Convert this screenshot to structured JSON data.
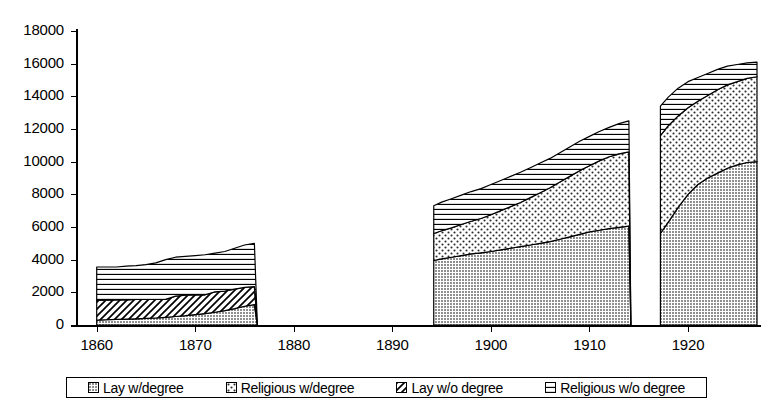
{
  "chart_data": {
    "type": "area",
    "title": "",
    "subtitle": "",
    "xlabel": "",
    "ylabel": "",
    "stacked": true,
    "grid": false,
    "legend_position": "bottom",
    "xlim": [
      1858,
      1927
    ],
    "ylim": [
      0,
      18000
    ],
    "y_ticks": [
      0,
      2000,
      4000,
      6000,
      8000,
      10000,
      12000,
      14000,
      16000,
      18000
    ],
    "y_tick_labels": [
      "0",
      "2000",
      "4000",
      "6000",
      "8000",
      "10000",
      "12000",
      "14000",
      "16000",
      "18000"
    ],
    "x_ticks": [
      1860,
      1870,
      1880,
      1890,
      1900,
      1910,
      1920
    ],
    "x_tick_labels": [
      "1860",
      "1870",
      "1880",
      "1890",
      "1900",
      "1910",
      "1920"
    ],
    "series": [
      {
        "name": "Lay w/degree",
        "pattern": "dense-dark-dots",
        "color": "#9a9a9a",
        "values": [
          {
            "x": 1860,
            "y": 300
          },
          {
            "x": 1861,
            "y": 320
          },
          {
            "x": 1862,
            "y": 340
          },
          {
            "x": 1863,
            "y": 360
          },
          {
            "x": 1864,
            "y": 380
          },
          {
            "x": 1865,
            "y": 400
          },
          {
            "x": 1866,
            "y": 430
          },
          {
            "x": 1867,
            "y": 470
          },
          {
            "x": 1868,
            "y": 520
          },
          {
            "x": 1869,
            "y": 570
          },
          {
            "x": 1870,
            "y": 640
          },
          {
            "x": 1871,
            "y": 700
          },
          {
            "x": 1872,
            "y": 780
          },
          {
            "x": 1873,
            "y": 880
          },
          {
            "x": 1874,
            "y": 1000
          },
          {
            "x": 1875,
            "y": 1150
          },
          {
            "x": 1876,
            "y": 1250
          },
          {
            "x": 1876.3,
            "y": 0
          },
          {
            "x": 1894,
            "y": 0
          },
          {
            "x": 1894.2,
            "y": 3950
          },
          {
            "x": 1895,
            "y": 4050
          },
          {
            "x": 1896,
            "y": 4150
          },
          {
            "x": 1897,
            "y": 4250
          },
          {
            "x": 1898,
            "y": 4350
          },
          {
            "x": 1899,
            "y": 4420
          },
          {
            "x": 1900,
            "y": 4500
          },
          {
            "x": 1901,
            "y": 4600
          },
          {
            "x": 1902,
            "y": 4700
          },
          {
            "x": 1903,
            "y": 4800
          },
          {
            "x": 1904,
            "y": 4900
          },
          {
            "x": 1905,
            "y": 5000
          },
          {
            "x": 1906,
            "y": 5100
          },
          {
            "x": 1907,
            "y": 5250
          },
          {
            "x": 1908,
            "y": 5400
          },
          {
            "x": 1909,
            "y": 5550
          },
          {
            "x": 1910,
            "y": 5700
          },
          {
            "x": 1911,
            "y": 5800
          },
          {
            "x": 1912,
            "y": 5900
          },
          {
            "x": 1913,
            "y": 5980
          },
          {
            "x": 1914,
            "y": 6050
          },
          {
            "x": 1914.2,
            "y": 0
          },
          {
            "x": 1917,
            "y": 0
          },
          {
            "x": 1917.2,
            "y": 5600
          },
          {
            "x": 1918,
            "y": 6300
          },
          {
            "x": 1919,
            "y": 7200
          },
          {
            "x": 1920,
            "y": 8000
          },
          {
            "x": 1921,
            "y": 8600
          },
          {
            "x": 1922,
            "y": 9000
          },
          {
            "x": 1923,
            "y": 9300
          },
          {
            "x": 1924,
            "y": 9600
          },
          {
            "x": 1925,
            "y": 9800
          },
          {
            "x": 1926,
            "y": 9950
          },
          {
            "x": 1927,
            "y": 10000
          }
        ]
      },
      {
        "name": "Religious w/degree",
        "pattern": "light-dots",
        "color": "#ffffff",
        "values": [
          {
            "x": 1860,
            "y": 0
          },
          {
            "x": 1876,
            "y": 0
          },
          {
            "x": 1876.3,
            "y": 0
          },
          {
            "x": 1894,
            "y": 0
          },
          {
            "x": 1894.2,
            "y": 1650
          },
          {
            "x": 1895,
            "y": 1720
          },
          {
            "x": 1896,
            "y": 1800
          },
          {
            "x": 1897,
            "y": 1900
          },
          {
            "x": 1898,
            "y": 2000
          },
          {
            "x": 1899,
            "y": 2100
          },
          {
            "x": 1900,
            "y": 2250
          },
          {
            "x": 1901,
            "y": 2400
          },
          {
            "x": 1902,
            "y": 2550
          },
          {
            "x": 1903,
            "y": 2700
          },
          {
            "x": 1904,
            "y": 2900
          },
          {
            "x": 1905,
            "y": 3100
          },
          {
            "x": 1906,
            "y": 3300
          },
          {
            "x": 1907,
            "y": 3500
          },
          {
            "x": 1908,
            "y": 3700
          },
          {
            "x": 1909,
            "y": 3900
          },
          {
            "x": 1910,
            "y": 4050
          },
          {
            "x": 1911,
            "y": 4250
          },
          {
            "x": 1912,
            "y": 4400
          },
          {
            "x": 1913,
            "y": 4500
          },
          {
            "x": 1914,
            "y": 4550
          },
          {
            "x": 1914.2,
            "y": 0
          },
          {
            "x": 1917,
            "y": 0
          },
          {
            "x": 1917.2,
            "y": 6000
          },
          {
            "x": 1918,
            "y": 5900
          },
          {
            "x": 1919,
            "y": 5600
          },
          {
            "x": 1920,
            "y": 5300
          },
          {
            "x": 1921,
            "y": 5100
          },
          {
            "x": 1922,
            "y": 5050
          },
          {
            "x": 1923,
            "y": 5100
          },
          {
            "x": 1924,
            "y": 5100
          },
          {
            "x": 1925,
            "y": 5100
          },
          {
            "x": 1926,
            "y": 5150
          },
          {
            "x": 1927,
            "y": 5200
          }
        ]
      },
      {
        "name": "Lay w/o degree",
        "pattern": "diagonal-hatch",
        "color": "#ffffff",
        "values": [
          {
            "x": 1860,
            "y": 1200
          },
          {
            "x": 1861,
            "y": 1200
          },
          {
            "x": 1862,
            "y": 1200
          },
          {
            "x": 1863,
            "y": 1180
          },
          {
            "x": 1864,
            "y": 1180
          },
          {
            "x": 1865,
            "y": 1160
          },
          {
            "x": 1866,
            "y": 1130
          },
          {
            "x": 1867,
            "y": 1100
          },
          {
            "x": 1868,
            "y": 1250
          },
          {
            "x": 1869,
            "y": 1250
          },
          {
            "x": 1870,
            "y": 1200
          },
          {
            "x": 1871,
            "y": 1150
          },
          {
            "x": 1872,
            "y": 1250
          },
          {
            "x": 1873,
            "y": 1200
          },
          {
            "x": 1874,
            "y": 1200
          },
          {
            "x": 1875,
            "y": 1150
          },
          {
            "x": 1876,
            "y": 1100
          },
          {
            "x": 1876.3,
            "y": 0
          },
          {
            "x": 1894,
            "y": 0
          },
          {
            "x": 1914.2,
            "y": 0
          },
          {
            "x": 1917,
            "y": 0
          },
          {
            "x": 1927,
            "y": 0
          }
        ]
      },
      {
        "name": "Religious w/o degree",
        "pattern": "horizontal-lines",
        "color": "#ffffff",
        "values": [
          {
            "x": 1860,
            "y": 2050
          },
          {
            "x": 1861,
            "y": 2030
          },
          {
            "x": 1862,
            "y": 2010
          },
          {
            "x": 1863,
            "y": 2060
          },
          {
            "x": 1864,
            "y": 2080
          },
          {
            "x": 1865,
            "y": 2140
          },
          {
            "x": 1866,
            "y": 2240
          },
          {
            "x": 1867,
            "y": 2430
          },
          {
            "x": 1868,
            "y": 2380
          },
          {
            "x": 1869,
            "y": 2380
          },
          {
            "x": 1870,
            "y": 2410
          },
          {
            "x": 1871,
            "y": 2450
          },
          {
            "x": 1872,
            "y": 2370
          },
          {
            "x": 1873,
            "y": 2420
          },
          {
            "x": 1874,
            "y": 2500
          },
          {
            "x": 1875,
            "y": 2600
          },
          {
            "x": 1876,
            "y": 2650
          },
          {
            "x": 1876.3,
            "y": 0
          },
          {
            "x": 1894,
            "y": 0
          },
          {
            "x": 1894.2,
            "y": 1700
          },
          {
            "x": 1895,
            "y": 1750
          },
          {
            "x": 1896,
            "y": 1780
          },
          {
            "x": 1897,
            "y": 1800
          },
          {
            "x": 1898,
            "y": 1820
          },
          {
            "x": 1899,
            "y": 1830
          },
          {
            "x": 1900,
            "y": 1850
          },
          {
            "x": 1901,
            "y": 1850
          },
          {
            "x": 1902,
            "y": 1850
          },
          {
            "x": 1903,
            "y": 1850
          },
          {
            "x": 1904,
            "y": 1830
          },
          {
            "x": 1905,
            "y": 1820
          },
          {
            "x": 1906,
            "y": 1800
          },
          {
            "x": 1907,
            "y": 1800
          },
          {
            "x": 1908,
            "y": 1800
          },
          {
            "x": 1909,
            "y": 1800
          },
          {
            "x": 1910,
            "y": 1800
          },
          {
            "x": 1911,
            "y": 1800
          },
          {
            "x": 1912,
            "y": 1800
          },
          {
            "x": 1913,
            "y": 1850
          },
          {
            "x": 1914,
            "y": 1900
          },
          {
            "x": 1914.2,
            "y": 0
          },
          {
            "x": 1917,
            "y": 0
          },
          {
            "x": 1917.2,
            "y": 1800
          },
          {
            "x": 1918,
            "y": 1750
          },
          {
            "x": 1919,
            "y": 1700
          },
          {
            "x": 1920,
            "y": 1600
          },
          {
            "x": 1921,
            "y": 1450
          },
          {
            "x": 1922,
            "y": 1350
          },
          {
            "x": 1923,
            "y": 1250
          },
          {
            "x": 1924,
            "y": 1150
          },
          {
            "x": 1925,
            "y": 1050
          },
          {
            "x": 1926,
            "y": 950
          },
          {
            "x": 1927,
            "y": 900
          }
        ]
      }
    ],
    "annotations": []
  },
  "legend": {
    "entries": [
      {
        "label": "Lay w/degree",
        "swatch": "dense-dark-dots"
      },
      {
        "label": "Religious w/degree",
        "swatch": "light-dots"
      },
      {
        "label": "Lay w/o degree",
        "swatch": "diagonal-hatch"
      },
      {
        "label": "Religious w/o degree",
        "swatch": "horizontal-lines"
      }
    ]
  }
}
